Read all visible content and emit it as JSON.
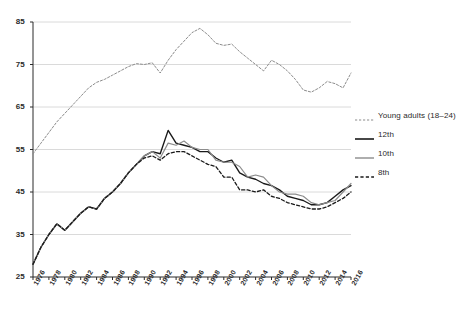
{
  "chart_data": {
    "type": "line",
    "title": "",
    "subtitle": "",
    "xlabel": "",
    "ylabel": "",
    "xlim": [
      1976,
      2016
    ],
    "ylim": [
      25,
      85
    ],
    "grid": "horizontal",
    "legend_position": "right",
    "y_ticks": [
      25,
      35,
      45,
      55,
      65,
      75,
      85
    ],
    "x_ticks": [
      1976,
      1978,
      1980,
      1982,
      1984,
      1986,
      1988,
      1990,
      1992,
      1994,
      1996,
      1998,
      2000,
      2002,
      2004,
      2006,
      2008,
      2010,
      2012,
      2014,
      2016
    ],
    "x": [
      1976,
      1977,
      1978,
      1979,
      1980,
      1981,
      1982,
      1983,
      1984,
      1985,
      1986,
      1987,
      1988,
      1989,
      1990,
      1991,
      1992,
      1993,
      1994,
      1995,
      1996,
      1997,
      1998,
      1999,
      2000,
      2001,
      2002,
      2003,
      2004,
      2005,
      2006,
      2007,
      2008,
      2009,
      2010,
      2011,
      2012,
      2013,
      2014,
      2015,
      2016
    ],
    "series": [
      {
        "name": "Young adults (18–24)",
        "style": "fine-dashed",
        "color": "#8c8c8c",
        "width": 1,
        "values": [
          54.0,
          56.5,
          59.0,
          61.5,
          63.5,
          65.5,
          67.5,
          69.5,
          70.8,
          71.5,
          72.5,
          73.5,
          74.5,
          75.2,
          75.0,
          75.4,
          73.0,
          76.0,
          78.5,
          80.5,
          82.5,
          83.5,
          82.0,
          80.0,
          79.5,
          79.8,
          78.0,
          76.5,
          75.0,
          73.5,
          76.0,
          75.0,
          73.5,
          71.5,
          69.0,
          68.5,
          69.5,
          71.0,
          70.5,
          69.5,
          73.0
        ]
      },
      {
        "name": "12th",
        "style": "solid",
        "color": "#1a1a1a",
        "width": 1.4,
        "values": [
          28.0,
          32.0,
          35.0,
          37.5,
          36.0,
          38.0,
          40.0,
          41.5,
          41.0,
          43.5,
          45.0,
          47.0,
          49.5,
          51.5,
          53.5,
          54.5,
          54.0,
          59.5,
          56.5,
          56.0,
          55.5,
          54.5,
          54.5,
          53.0,
          52.0,
          52.5,
          49.5,
          48.5,
          48.0,
          47.0,
          46.5,
          45.5,
          44.0,
          43.5,
          43.0,
          42.0,
          42.0,
          42.5,
          44.0,
          45.5,
          46.5
        ]
      },
      {
        "name": "10th",
        "style": "solid",
        "color": "#8c8c8c",
        "width": 1.2,
        "values": [
          28.0,
          32.0,
          35.0,
          37.5,
          36.0,
          38.0,
          40.0,
          41.5,
          41.0,
          43.5,
          45.0,
          47.0,
          49.5,
          51.5,
          53.5,
          54.5,
          53.0,
          56.5,
          56.0,
          57.0,
          55.5,
          55.0,
          55.0,
          52.5,
          52.0,
          52.0,
          51.0,
          48.5,
          49.0,
          48.5,
          46.5,
          45.0,
          44.5,
          44.5,
          44.0,
          42.5,
          42.0,
          42.5,
          43.0,
          45.0,
          47.0
        ]
      },
      {
        "name": "8th",
        "style": "dashed",
        "color": "#1a1a1a",
        "width": 1.3,
        "values": [
          28.0,
          32.0,
          35.0,
          37.5,
          36.0,
          38.0,
          40.0,
          41.5,
          41.0,
          43.5,
          45.0,
          47.0,
          49.5,
          51.5,
          53.0,
          53.5,
          52.5,
          54.0,
          54.5,
          54.5,
          53.5,
          52.5,
          51.5,
          51.0,
          48.5,
          48.5,
          45.5,
          45.5,
          45.0,
          45.5,
          44.0,
          43.5,
          42.5,
          42.0,
          41.5,
          41.0,
          41.0,
          41.5,
          42.5,
          43.5,
          45.0
        ]
      }
    ]
  },
  "legend": {
    "items": [
      {
        "label": "Young adults (18–24)"
      },
      {
        "label": "12th"
      },
      {
        "label": "10th"
      },
      {
        "label": "8th"
      }
    ]
  },
  "colors": {
    "axis": "#2b2b2b",
    "grid": "#d0d0d0",
    "background": "#ffffff"
  }
}
